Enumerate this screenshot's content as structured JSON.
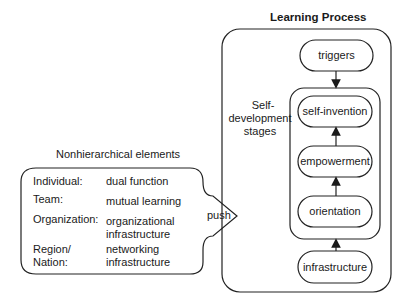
{
  "learning_process": {
    "title": "Learning Process",
    "side_label_line1": "Self-",
    "side_label_line2": "development",
    "side_label_line3": "stages",
    "nodes": [
      {
        "id": "triggers",
        "label": "triggers"
      },
      {
        "id": "self-invention",
        "label": "self-invention"
      },
      {
        "id": "empowerment",
        "label": "empowerment"
      },
      {
        "id": "orientation",
        "label": "orientation"
      },
      {
        "id": "infrastructure",
        "label": "infrastructure"
      }
    ]
  },
  "nonhierarchical": {
    "title": "Nonhierarchical elements",
    "rows": [
      {
        "level": "Individual:",
        "value": "dual function"
      },
      {
        "level": "Team:",
        "value": "mutual learning"
      },
      {
        "level": "Organization:",
        "value_line1": "organizational",
        "value_line2": "infrastructure"
      },
      {
        "level_line1": "Region/",
        "level_line2": "Nation:",
        "value_line1": "networking",
        "value_line2": "infrastructure"
      }
    ],
    "push_label": "push"
  }
}
